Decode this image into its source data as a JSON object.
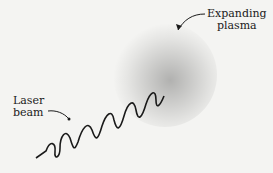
{
  "diagram": {
    "labels": {
      "plasma_line1": "Expanding",
      "plasma_line2": "plasma",
      "laser_line1": "Laser",
      "laser_line2": "beam"
    },
    "colors": {
      "background": "#f4f4f2",
      "ink": "#1a1a1a"
    }
  }
}
